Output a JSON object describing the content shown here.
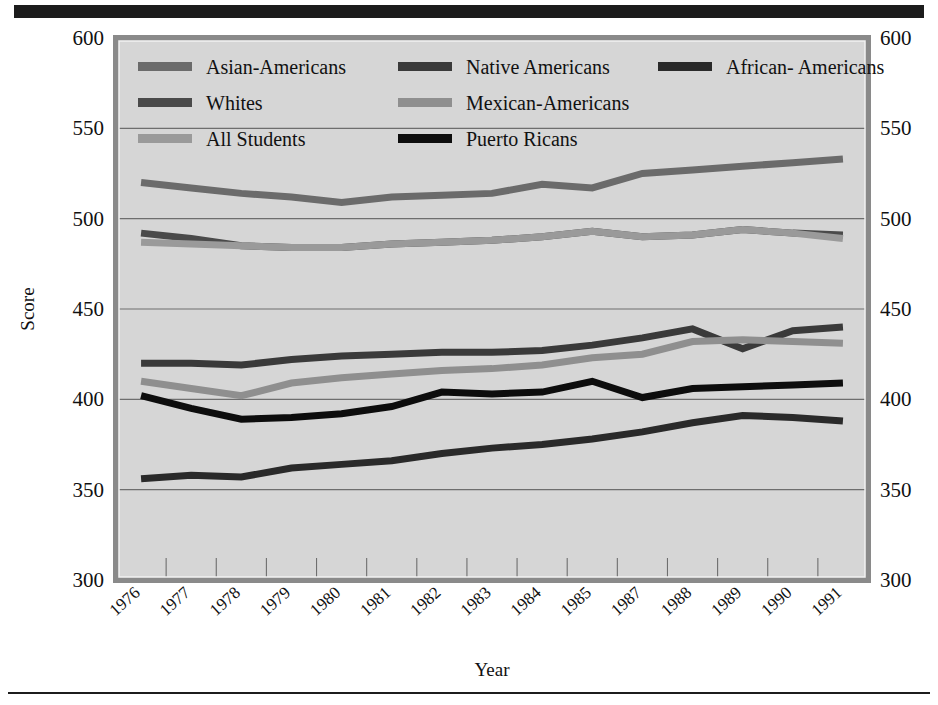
{
  "figure": {
    "title_bar_color": "#1c1c1c",
    "plot_background": "#d6d6d6",
    "plot_border_color": "#8a8a8a",
    "gridline_color": "#6e6e6e"
  },
  "chart_data": {
    "type": "line",
    "title": "",
    "xlabel": "Year",
    "ylabel": "Score",
    "ylim": [
      300,
      600
    ],
    "yticks": [
      300,
      350,
      400,
      450,
      500,
      550,
      600
    ],
    "ytick_labels_left": [
      "300",
      "350",
      "400",
      "450",
      "500",
      "550",
      "600"
    ],
    "ytick_labels_right": [
      "300",
      "350",
      "400",
      "450",
      "500",
      "550",
      "600"
    ],
    "grid": true,
    "legend_position": "upper-left-inside",
    "categories": [
      "1976",
      "1977",
      "1978",
      "1979",
      "1980",
      "1981",
      "1982",
      "1983",
      "1984",
      "1985",
      "1987",
      "1988",
      "1989",
      "1990",
      "1991"
    ],
    "series": [
      {
        "name": "Asian-Americans",
        "color": "#6b6b6b",
        "values": [
          520,
          517,
          514,
          512,
          509,
          512,
          513,
          514,
          519,
          517,
          525,
          527,
          529,
          531,
          533
        ]
      },
      {
        "name": "Whites",
        "color": "#4a4a4a",
        "values": [
          492,
          489,
          485,
          484,
          484,
          486,
          487,
          488,
          490,
          493,
          490,
          491,
          494,
          492,
          491
        ]
      },
      {
        "name": "All Students",
        "color": "#9a9a9a",
        "values": [
          487,
          486,
          485,
          484,
          484,
          486,
          487,
          488,
          490,
          493,
          490,
          491,
          494,
          492,
          489
        ]
      },
      {
        "name": "Native Americans",
        "color": "#3a3a3a",
        "values": [
          420,
          420,
          419,
          422,
          424,
          425,
          426,
          426,
          427,
          430,
          434,
          439,
          428,
          438,
          440
        ]
      },
      {
        "name": "Mexican-Americans",
        "color": "#8f8f8f",
        "values": [
          410,
          406,
          402,
          409,
          412,
          414,
          416,
          417,
          419,
          423,
          425,
          432,
          433,
          432,
          431
        ]
      },
      {
        "name": "Puerto Ricans",
        "color": "#0d0d0d",
        "values": [
          402,
          395,
          389,
          390,
          392,
          396,
          404,
          403,
          404,
          410,
          401,
          406,
          407,
          408,
          409
        ]
      },
      {
        "name": "African- Americans",
        "color": "#2a2a2a",
        "values": [
          356,
          358,
          357,
          362,
          364,
          366,
          370,
          373,
          375,
          378,
          382,
          387,
          391,
          390,
          388
        ]
      }
    ]
  },
  "legend": {
    "entries": [
      {
        "label": "Asian-Americans",
        "color": "#6b6b6b",
        "col": 0,
        "row": 0
      },
      {
        "label": "Native Americans",
        "color": "#3a3a3a",
        "col": 1,
        "row": 0
      },
      {
        "label": "African- Americans",
        "color": "#2a2a2a",
        "col": 2,
        "row": 0
      },
      {
        "label": "Whites",
        "color": "#4a4a4a",
        "col": 0,
        "row": 1
      },
      {
        "label": "Mexican-Americans",
        "color": "#8f8f8f",
        "col": 1,
        "row": 1
      },
      {
        "label": "All Students",
        "color": "#9a9a9a",
        "col": 0,
        "row": 2
      },
      {
        "label": "Puerto Ricans",
        "color": "#0d0d0d",
        "col": 1,
        "row": 2
      }
    ]
  }
}
